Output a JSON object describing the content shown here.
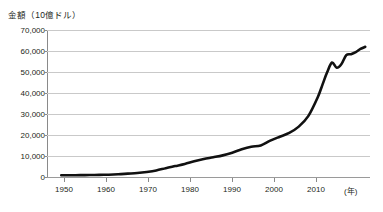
{
  "chart_data": {
    "type": "line",
    "title": "金額（10億ドル）",
    "xlabel": "(年)",
    "ylabel": "金額（10億ドル）",
    "xlim": [
      1948,
      2016
    ],
    "ylim": [
      0,
      70000
    ],
    "grid": true,
    "legend": "none",
    "y_ticks": [
      "70,000",
      "60,000",
      "50,000",
      "40,000",
      "30,000",
      "20,000",
      "10,000",
      "0"
    ],
    "y_tick_values": [
      70000,
      60000,
      50000,
      40000,
      30000,
      20000,
      10000,
      0
    ],
    "x_ticks": [
      "1950",
      "1960",
      "1970",
      "1980",
      "1990",
      "2000",
      "2010"
    ],
    "x_tick_values": [
      1950,
      1960,
      1970,
      1980,
      1990,
      2000,
      2010
    ],
    "series": [
      {
        "name": "世界の貿易額",
        "color": "#111111",
        "x": [
          1951,
          1953,
          1955,
          1957,
          1959,
          1961,
          1963,
          1965,
          1967,
          1969,
          1971,
          1973,
          1975,
          1977,
          1979,
          1981,
          1983,
          1985,
          1987,
          1989,
          1991,
          1993,
          1995,
          1997,
          1999,
          2001,
          2003,
          2005,
          2006,
          2007,
          2008,
          2009,
          2010,
          2011,
          2012,
          2013,
          2014,
          2015
        ],
        "values": [
          800,
          820,
          880,
          950,
          1000,
          1100,
          1300,
          1600,
          1900,
          2400,
          3100,
          4200,
          5200,
          6200,
          7500,
          8600,
          9400,
          10300,
          11600,
          13200,
          14400,
          15000,
          17300,
          19200,
          21000,
          24000,
          29000,
          38000,
          44000,
          50000,
          54500,
          52000,
          53800,
          58000,
          58500,
          59500,
          61000,
          62000
        ]
      }
    ],
    "annotations": [
      {
        "label": "2008年の山（約54,500）",
        "x": 2008,
        "y": 54500
      },
      {
        "label": "2009年の落ち込み（約52,000）",
        "x": 2009,
        "y": 52000
      },
      {
        "label": "終点（約62,000）",
        "x": 2015,
        "y": 62000
      }
    ]
  }
}
